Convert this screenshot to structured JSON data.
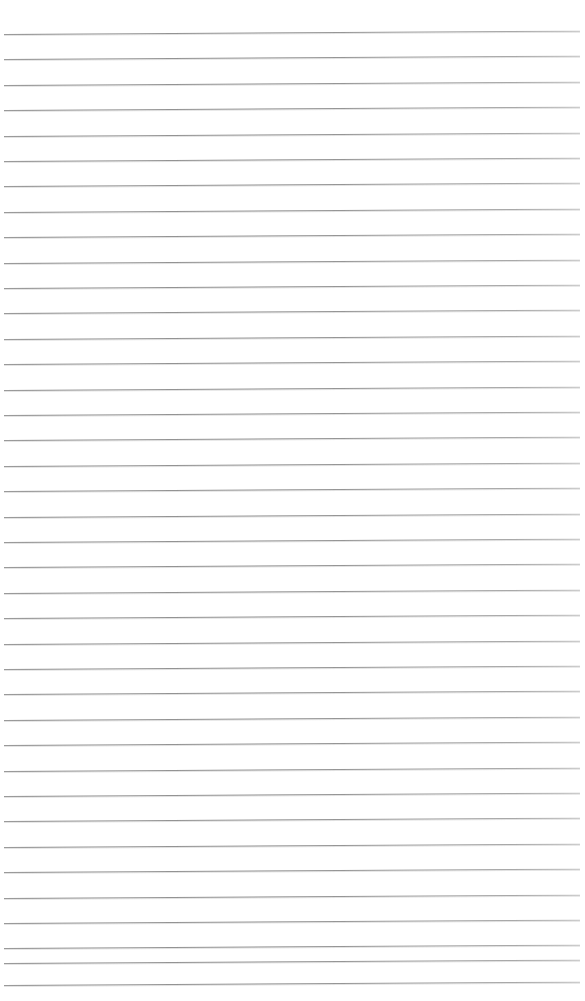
{
  "document": {
    "type": "ruled-paper",
    "title": "",
    "content_text": "",
    "is_blank": true,
    "page_width_px": 585,
    "page_height_px": 1001,
    "background_color": "#ffffff"
  },
  "ruling": {
    "line_color": "#8f8f8f",
    "line_color_light": "#c2c2c2",
    "line_count": 39,
    "line_thickness_px": 1,
    "first_line_y_px": 34,
    "line_spacing_px": 25.4,
    "line_start_x_px": 4,
    "line_end_x_px": 580,
    "skew_degrees": -0.33,
    "lines": [
      {
        "index": 1,
        "y": 34
      },
      {
        "index": 2,
        "y": 59
      },
      {
        "index": 3,
        "y": 85
      },
      {
        "index": 4,
        "y": 110
      },
      {
        "index": 5,
        "y": 136
      },
      {
        "index": 6,
        "y": 161
      },
      {
        "index": 7,
        "y": 186
      },
      {
        "index": 8,
        "y": 212
      },
      {
        "index": 9,
        "y": 237
      },
      {
        "index": 10,
        "y": 263
      },
      {
        "index": 11,
        "y": 288
      },
      {
        "index": 12,
        "y": 313
      },
      {
        "index": 13,
        "y": 339
      },
      {
        "index": 14,
        "y": 364
      },
      {
        "index": 15,
        "y": 390
      },
      {
        "index": 16,
        "y": 415
      },
      {
        "index": 17,
        "y": 440
      },
      {
        "index": 18,
        "y": 466
      },
      {
        "index": 19,
        "y": 491
      },
      {
        "index": 20,
        "y": 517
      },
      {
        "index": 21,
        "y": 542
      },
      {
        "index": 22,
        "y": 567
      },
      {
        "index": 23,
        "y": 593
      },
      {
        "index": 24,
        "y": 618
      },
      {
        "index": 25,
        "y": 644
      },
      {
        "index": 26,
        "y": 669
      },
      {
        "index": 27,
        "y": 694
      },
      {
        "index": 28,
        "y": 720
      },
      {
        "index": 29,
        "y": 745
      },
      {
        "index": 30,
        "y": 771
      },
      {
        "index": 31,
        "y": 796
      },
      {
        "index": 32,
        "y": 821
      },
      {
        "index": 33,
        "y": 847
      },
      {
        "index": 34,
        "y": 872
      },
      {
        "index": 35,
        "y": 898
      },
      {
        "index": 36,
        "y": 923
      },
      {
        "index": 37,
        "y": 948
      },
      {
        "index": 38,
        "y": 963
      },
      {
        "index": 39,
        "y": 985
      }
    ]
  }
}
